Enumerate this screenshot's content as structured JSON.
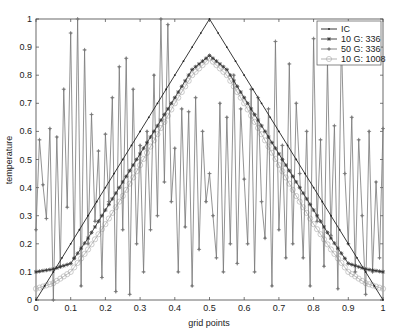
{
  "chart_data": {
    "type": "line",
    "title": "",
    "xlabel": "grid points",
    "ylabel": "temperature",
    "xlim": [
      0,
      1
    ],
    "ylim": [
      0,
      1
    ],
    "grid": false,
    "legend_position": "upper right",
    "xticks": [
      "0",
      "0.1",
      "0.2",
      "0.3",
      "0.4",
      "0.5",
      "0.6",
      "0.7",
      "0.8",
      "0.9",
      "1"
    ],
    "yticks": [
      "0",
      "0.1",
      "0.2",
      "0.3",
      "0.4",
      "0.5",
      "0.6",
      "0.7",
      "0.8",
      "0.9",
      "1"
    ],
    "series": [
      {
        "name": "IC",
        "marker": "dot",
        "x": [
          0,
          0.5,
          1
        ],
        "y": [
          0,
          1,
          0
        ]
      },
      {
        "name": "10 G: 336",
        "marker": "star",
        "x": [
          0,
          0.05,
          0.1,
          0.15,
          0.2,
          0.25,
          0.3,
          0.35,
          0.4,
          0.45,
          0.5,
          0.55,
          0.6,
          0.65,
          0.7,
          0.75,
          0.8,
          0.85,
          0.9,
          0.95,
          1
        ],
        "y": [
          0.1,
          0.11,
          0.13,
          0.22,
          0.32,
          0.42,
          0.52,
          0.62,
          0.72,
          0.82,
          0.87,
          0.82,
          0.72,
          0.62,
          0.52,
          0.42,
          0.32,
          0.22,
          0.13,
          0.11,
          0.1
        ]
      },
      {
        "name": "50 G: 336",
        "marker": "plus",
        "x": [
          0,
          0.01,
          0.02,
          0.03,
          0.04,
          0.05,
          0.06,
          0.07,
          0.08,
          0.09,
          0.1,
          0.11,
          0.12,
          0.13,
          0.14,
          0.15,
          0.16,
          0.17,
          0.18,
          0.19,
          0.2,
          0.21,
          0.22,
          0.23,
          0.24,
          0.25,
          0.26,
          0.27,
          0.28,
          0.29,
          0.3,
          0.31,
          0.32,
          0.33,
          0.34,
          0.35,
          0.36,
          0.37,
          0.38,
          0.39,
          0.4,
          0.41,
          0.42,
          0.43,
          0.44,
          0.45,
          0.46,
          0.47,
          0.48,
          0.49,
          0.5,
          0.51,
          0.52,
          0.53,
          0.54,
          0.55,
          0.56,
          0.57,
          0.58,
          0.59,
          0.6,
          0.61,
          0.62,
          0.63,
          0.64,
          0.65,
          0.66,
          0.67,
          0.68,
          0.69,
          0.7,
          0.71,
          0.72,
          0.73,
          0.74,
          0.75,
          0.76,
          0.77,
          0.78,
          0.79,
          0.8,
          0.81,
          0.82,
          0.83,
          0.84,
          0.85,
          0.86,
          0.87,
          0.88,
          0.89,
          0.9,
          0.91,
          0.92,
          0.93,
          0.94,
          0.95,
          0.96,
          0.97,
          0.98,
          0.99,
          1
        ],
        "y": [
          0.25,
          0.57,
          0.41,
          0.29,
          0.61,
          0.0,
          0.58,
          0.12,
          0.75,
          0.33,
          0.95,
          0.15,
          1.0,
          0.05,
          0.89,
          0.2,
          0.66,
          0.28,
          0.53,
          0.08,
          0.59,
          0.35,
          0.72,
          0.03,
          0.83,
          0.25,
          0.86,
          0.02,
          0.75,
          0.2,
          0.55,
          0.1,
          0.6,
          0.25,
          0.8,
          0.3,
          1.0,
          0.42,
          0.98,
          0.35,
          0.54,
          0.1,
          0.68,
          0.26,
          0.67,
          0.05,
          0.72,
          0.18,
          0.6,
          0.35,
          0.45,
          0.3,
          0.15,
          0.7,
          0.1,
          0.65,
          0.2,
          0.8,
          0.13,
          0.68,
          0.43,
          0.2,
          0.75,
          0.1,
          0.72,
          0.35,
          0.22,
          0.68,
          0.05,
          0.92,
          0.25,
          0.55,
          0.15,
          0.84,
          0.2,
          0.7,
          0.45,
          0.15,
          0.6,
          0.05,
          0.93,
          0.28,
          0.57,
          0.12,
          0.85,
          0.23,
          0.62,
          0.04,
          0.93,
          0.45,
          0.2,
          0.65,
          0.1,
          0.57,
          0.3,
          0.02,
          0.6,
          0.1,
          0.42,
          0.15,
          0.61
        ]
      },
      {
        "name": "10 G: 1008",
        "marker": "circle",
        "x": [
          0,
          0.05,
          0.1,
          0.15,
          0.2,
          0.25,
          0.3,
          0.35,
          0.4,
          0.45,
          0.5,
          0.55,
          0.6,
          0.65,
          0.7,
          0.75,
          0.8,
          0.85,
          0.9,
          0.95,
          1
        ],
        "y": [
          0.04,
          0.06,
          0.1,
          0.18,
          0.27,
          0.37,
          0.48,
          0.59,
          0.7,
          0.8,
          0.86,
          0.8,
          0.7,
          0.59,
          0.48,
          0.37,
          0.27,
          0.18,
          0.1,
          0.06,
          0.04
        ]
      }
    ]
  }
}
